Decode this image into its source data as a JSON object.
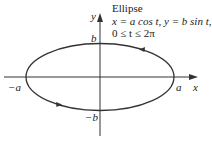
{
  "figure": {
    "title": "Ellipse",
    "equation": "x = a cos t, y = b sin t,",
    "range": "0 ≤ t ≤ 2π",
    "axes": {
      "x_label": "x",
      "y_label": "y"
    },
    "points": {
      "pos_a": "a",
      "neg_a": "−a",
      "pos_b": "b",
      "neg_b": "−b"
    },
    "colors": {
      "stroke": "#333333",
      "text": "#222222"
    }
  }
}
